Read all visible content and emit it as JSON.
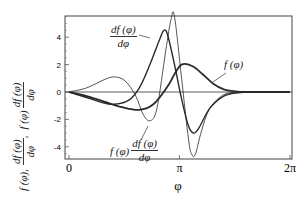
{
  "chart_data": {
    "type": "line",
    "title": "",
    "xlabel": "φ",
    "ylabel": "f(φ), df(φ)/dφ, f(φ) df(φ)/dφ",
    "xlim": [
      0,
      6.2832
    ],
    "ylim": [
      -4.8,
      5.6
    ],
    "xticks": [
      {
        "value": 0,
        "label": "0"
      },
      {
        "value": 3.1416,
        "label": "π"
      },
      {
        "value": 6.2832,
        "label": "2π"
      }
    ],
    "yticks": [
      {
        "value": -4,
        "label": "-4"
      },
      {
        "value": -2,
        "label": "-2"
      },
      {
        "value": 0,
        "label": "0"
      },
      {
        "value": 2,
        "label": "2"
      },
      {
        "value": 4,
        "label": "4"
      }
    ],
    "grid": false,
    "legend": "inline annotations",
    "series": [
      {
        "name": "f(φ)",
        "style": "thick",
        "x": [
          0,
          0.5,
          1.0,
          1.5,
          2.0,
          2.4,
          2.8,
          3.0,
          3.2,
          3.5,
          3.8,
          4.1,
          4.4,
          4.8,
          5.3,
          6.28
        ],
        "y": [
          0,
          -0.3,
          -0.7,
          -1.1,
          -1.3,
          -0.9,
          0.4,
          1.3,
          2.0,
          1.9,
          1.3,
          0.6,
          0.2,
          0.03,
          0,
          0
        ]
      },
      {
        "name": "df(φ)/dφ",
        "style": "medium",
        "x": [
          0,
          0.5,
          1.0,
          1.3,
          1.7,
          2.0,
          2.3,
          2.6,
          2.7,
          2.8,
          3.0,
          3.2,
          3.4,
          3.55,
          3.7,
          4.0,
          4.4,
          4.8,
          5.3,
          6.28
        ],
        "y": [
          0,
          -0.4,
          -0.8,
          -0.9,
          -0.6,
          0.3,
          2.0,
          4.0,
          4.5,
          4.2,
          2.0,
          -0.5,
          -2.5,
          -3.0,
          -2.6,
          -1.2,
          -0.3,
          -0.05,
          0,
          0
        ]
      },
      {
        "name": "f(φ) df(φ)/dφ",
        "style": "thin",
        "x": [
          0,
          0.5,
          1.0,
          1.3,
          1.6,
          1.9,
          2.1,
          2.3,
          2.5,
          2.75,
          2.9,
          3.0,
          3.2,
          3.4,
          3.5,
          3.6,
          3.75,
          4.0,
          4.4,
          4.8,
          5.3,
          6.28
        ],
        "y": [
          0,
          0.3,
          0.9,
          1.1,
          0.8,
          -0.3,
          -1.6,
          -2.1,
          -1.2,
          3.0,
          5.3,
          5.5,
          1.0,
          -3.5,
          -4.6,
          -4.5,
          -3.0,
          -1.2,
          -0.2,
          -0.02,
          0,
          0
        ]
      }
    ],
    "annotations": [
      {
        "text": "df(φ)/dφ",
        "target": "df(φ)/dφ"
      },
      {
        "text": "f(φ)",
        "target": "f(φ)"
      },
      {
        "text": "f(φ) df(φ)/dφ",
        "target": "f(φ) df(φ)/dφ"
      }
    ]
  },
  "labels": {
    "y_f": "f (φ),",
    "y_dnum": "df (φ)",
    "y_dden": "dφ",
    "y_comma": ",",
    "y_f2": "f (φ)",
    "ann_df_num": "df (φ)",
    "ann_df_den": "dφ",
    "ann_f": "f (φ)",
    "ann_prod_f": "f (φ)",
    "ann_prod_num": "df (φ)",
    "ann_prod_den": "dφ",
    "xaxis": "φ"
  }
}
